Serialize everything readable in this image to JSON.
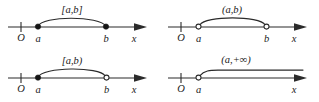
{
  "figure": {
    "stroke_color": "#2b2b2b",
    "dot_fill_closed": "#151515",
    "dot_fill_open": "#ffffff",
    "background": "#ffffff"
  },
  "panels": [
    {
      "id": "closed-interval",
      "interval_label": "[a,b]",
      "origin_label": "O",
      "left_endpoint_label": "a",
      "right_endpoint_label": "b",
      "axis_label": "x",
      "left_endpoint_type": "closed",
      "right_endpoint_type": "closed",
      "ray": false
    },
    {
      "id": "open-interval",
      "interval_label": "(a,b)",
      "origin_label": "O",
      "left_endpoint_label": "a",
      "right_endpoint_label": "b",
      "axis_label": "x",
      "left_endpoint_type": "open",
      "right_endpoint_type": "open",
      "ray": false
    },
    {
      "id": "half-open-interval",
      "interval_label": "[a,b)",
      "origin_label": "O",
      "left_endpoint_label": "a",
      "right_endpoint_label": "b",
      "axis_label": "x",
      "left_endpoint_type": "closed",
      "right_endpoint_type": "open",
      "ray": false
    },
    {
      "id": "infinite-interval",
      "interval_label": "(a,+∞)",
      "origin_label": "O",
      "left_endpoint_label": "a",
      "right_endpoint_label": "",
      "axis_label": "x",
      "left_endpoint_type": "open",
      "right_endpoint_type": "infinite",
      "ray": true
    }
  ]
}
